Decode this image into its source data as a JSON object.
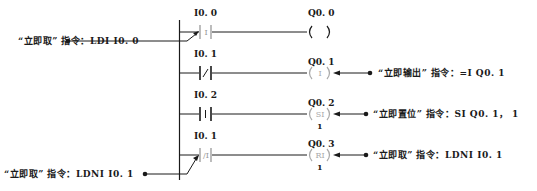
{
  "diagram": {
    "type": "ladder-diagram",
    "rungs": [
      {
        "contact": {
          "address": "I0. 0",
          "type": "immediate-NO",
          "symbol": "I"
        },
        "coil": {
          "address": "Q0. 0",
          "type": "normal",
          "symbol": "",
          "count": ""
        },
        "annotation": {
          "side": "left",
          "text": "“立即取” 指令：LDI   I0. 0"
        }
      },
      {
        "contact": {
          "address": "I0. 1",
          "type": "NC",
          "symbol": "/"
        },
        "coil": {
          "address": "Q0. 1",
          "type": "immediate-output",
          "symbol": "I",
          "count": ""
        },
        "annotation": {
          "side": "right",
          "text": "“立即输出” 指令：=I   Q0. 1"
        }
      },
      {
        "contact": {
          "address": "I0. 2",
          "type": "NO",
          "symbol": "I"
        },
        "coil": {
          "address": "Q0. 2",
          "type": "immediate-set",
          "symbol": "SI",
          "count": "1"
        },
        "annotation": {
          "side": "right",
          "text": "“立即置位” 指令：SI   Q0. 1，  1"
        }
      },
      {
        "contact": {
          "address": "I0. 1",
          "type": "immediate-NC",
          "symbol": "/I"
        },
        "coil": {
          "address": "Q0. 3",
          "type": "immediate-reset",
          "symbol": "RI",
          "count": "1"
        },
        "annotation": {
          "side": "left",
          "text": "“立即取” 指令：LDNI   I0. 1"
        }
      }
    ]
  },
  "colors": {
    "line": "#1a1a1a",
    "faded": "#aaaaaa",
    "background": "#ffffff"
  }
}
